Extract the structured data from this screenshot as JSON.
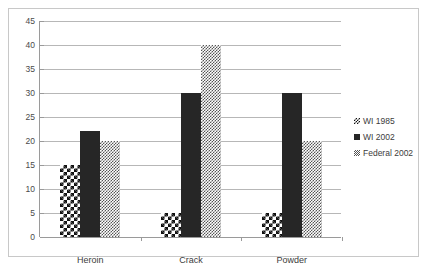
{
  "chart_data": {
    "type": "bar",
    "title": "",
    "xlabel": "",
    "ylabel": "",
    "categories": [
      "Heroin",
      "Crack",
      "Powder"
    ],
    "series": [
      {
        "name": "WI 1985",
        "values": [
          15,
          5,
          5
        ],
        "pattern": "checkerboard"
      },
      {
        "name": "WI 2002",
        "values": [
          22,
          30,
          30
        ],
        "pattern": "solid-black"
      },
      {
        "name": "Federal 2002",
        "values": [
          20,
          40,
          20
        ],
        "pattern": "fine-dither"
      }
    ],
    "ylim": [
      0,
      45
    ],
    "ytick_step": 5,
    "yticks": [
      0,
      5,
      10,
      15,
      20,
      25,
      30,
      35,
      40,
      45
    ],
    "grid": true,
    "legend_position": "right"
  },
  "colors": {
    "series_0": "#111111",
    "series_1": "#262626",
    "series_2": "#555555",
    "gridline": "#b7b7b7",
    "axis": "#9a9a9a",
    "frame": "#c8c8c8",
    "text": "#3c3c3c",
    "background": "#ffffff"
  }
}
